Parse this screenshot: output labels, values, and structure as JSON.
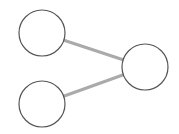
{
  "diagram": {
    "background": "#ffffff",
    "node_stroke": "#555555",
    "node_fill": "#ffffff",
    "edge_color": "#aaaaaa",
    "nodes": [
      {
        "id": "top-left",
        "cx": 42,
        "cy": 33,
        "r": 23
      },
      {
        "id": "bottom-left",
        "cx": 42,
        "cy": 104,
        "r": 23
      },
      {
        "id": "right",
        "cx": 145,
        "cy": 67,
        "r": 23
      }
    ],
    "edges": [
      {
        "from": "top-left",
        "to": "right"
      },
      {
        "from": "bottom-left",
        "to": "right"
      }
    ]
  }
}
